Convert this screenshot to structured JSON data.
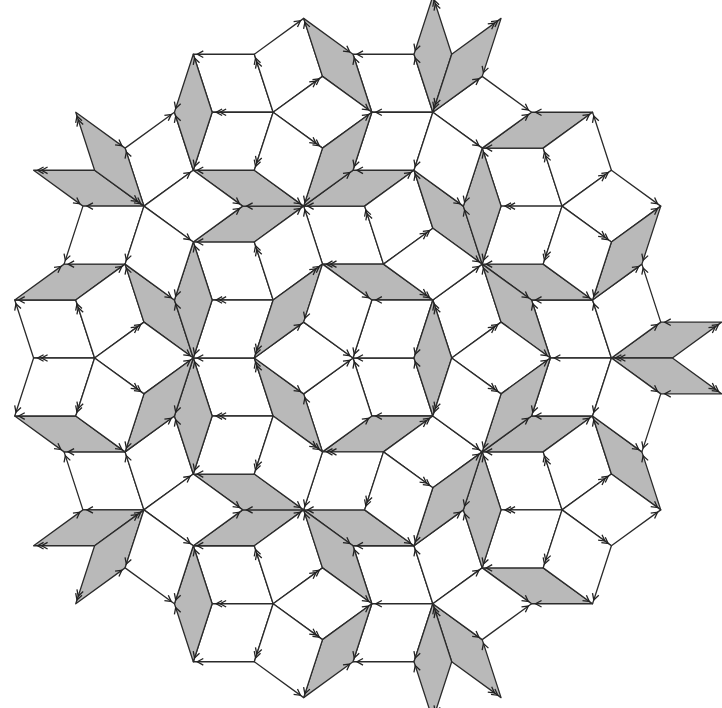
{
  "diagram": {
    "kind": "penrose-rhombus-tiling",
    "title": "",
    "width": 722,
    "height": 708,
    "center": [
      353,
      358
    ],
    "edge_length": 61,
    "rotation_deg": 180,
    "gamma": [
      0.2000001,
      0.1999998,
      0.2000003,
      0.1999999,
      0.1999999
    ],
    "grid_range": 9,
    "tile_center_radius": 316,
    "tiles": {
      "fat": {
        "label": "fat rhombus (72°)",
        "fill": "#ffffff"
      },
      "thin": {
        "label": "thin rhombus (36°)",
        "fill": "#b9b9b9"
      }
    },
    "stroke_color": "#2b2b2b",
    "stroke_width": 1.3,
    "arrow": {
      "size": 6,
      "inset": 4,
      "color": "#222222"
    },
    "center_vertex": "five-fold star of fat rhombi"
  }
}
